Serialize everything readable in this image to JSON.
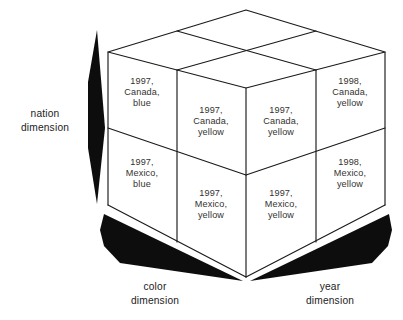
{
  "diagram": {
    "shape": "cube",
    "line_color": "#1a1a1a",
    "face_color": "#ffffff",
    "arrow_color": "#0d0d0d",
    "text_color": "#33332f",
    "axis_label_color": "#222222"
  },
  "axes": [
    {
      "id": "nation",
      "line1": "nation",
      "line2": "dimension",
      "position": "left"
    },
    {
      "id": "color",
      "line1": "color",
      "line2": "dimension",
      "position": "bottom-left"
    },
    {
      "id": "year",
      "line1": "year",
      "line2": "dimension",
      "position": "bottom-right"
    }
  ],
  "cells": [
    {
      "id": "left-top",
      "face": "left",
      "row": "top",
      "col": "outer",
      "line1": "1997,",
      "line2": "Canada,",
      "line3": "blue"
    },
    {
      "id": "left-top-inner",
      "face": "left",
      "row": "top",
      "col": "inner",
      "line1": "1997,",
      "line2": "Canada,",
      "line3": "yellow"
    },
    {
      "id": "right-top-inner",
      "face": "right",
      "row": "top",
      "col": "inner",
      "line1": "1997,",
      "line2": "Canada,",
      "line3": "yellow"
    },
    {
      "id": "right-top",
      "face": "right",
      "row": "top",
      "col": "outer",
      "line1": "1998,",
      "line2": "Canada,",
      "line3": "yellow"
    },
    {
      "id": "left-bottom",
      "face": "left",
      "row": "bottom",
      "col": "outer",
      "line1": "1997,",
      "line2": "Mexico,",
      "line3": "blue"
    },
    {
      "id": "left-bottom-inner",
      "face": "left",
      "row": "bottom",
      "col": "inner",
      "line1": "1997,",
      "line2": "Mexico,",
      "line3": "yellow"
    },
    {
      "id": "right-bottom-inner",
      "face": "right",
      "row": "bottom",
      "col": "inner",
      "line1": "1997,",
      "line2": "Mexico,",
      "line3": "yellow"
    },
    {
      "id": "right-bottom",
      "face": "right",
      "row": "bottom",
      "col": "outer",
      "line1": "1998,",
      "line2": "Mexico,",
      "line3": "yellow"
    }
  ]
}
